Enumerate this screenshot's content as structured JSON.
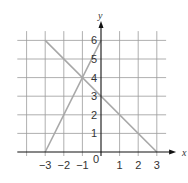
{
  "chart_data": {
    "type": "line",
    "title": "",
    "xlabel": "x",
    "ylabel": "y",
    "xlim": [
      -4,
      3.5
    ],
    "ylim": [
      0,
      6.5
    ],
    "grid": true,
    "x_ticks": [
      "-3",
      "-2",
      "-1",
      "0",
      "1",
      "2",
      "3"
    ],
    "y_ticks": [
      "1",
      "2",
      "3",
      "4",
      "5",
      "6"
    ],
    "origin_label": "0",
    "series": [
      {
        "name": "line-1",
        "equation": "y = 2x + 6",
        "points": [
          [
            -3,
            0
          ],
          [
            0,
            6
          ]
        ]
      },
      {
        "name": "line-2",
        "equation": "y = -x + 3",
        "points": [
          [
            -3,
            6
          ],
          [
            3,
            0
          ]
        ]
      }
    ],
    "intersection": [
      -1,
      4
    ],
    "colors": {
      "grid": "#9a9a9a",
      "axis": "#111111",
      "line": "#a8a8a8",
      "text": "#333333"
    }
  }
}
